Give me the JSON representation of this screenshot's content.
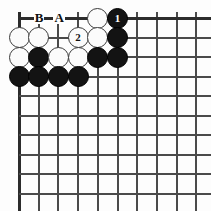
{
  "diagram": {
    "type": "go-board-problem",
    "board": {
      "columns": 10,
      "rows": 10,
      "origin_x": 19,
      "origin_y": 18,
      "spacing_x": 19.7,
      "spacing_y": 19.5,
      "line_color": "#4a4a4a",
      "edge_color": "#2c2c2c",
      "background": "#fdfdfd",
      "top_edge_row": 0,
      "left_edge_col": 0
    },
    "stones": [
      {
        "id": "w-r0c4",
        "color": "white",
        "col": 4,
        "row": 0,
        "label": ""
      },
      {
        "id": "b-r0c5",
        "color": "black",
        "col": 5,
        "row": 0,
        "label": "1"
      },
      {
        "id": "w-r1c0",
        "color": "white",
        "col": 0,
        "row": 1,
        "label": ""
      },
      {
        "id": "w-r1c1",
        "color": "white",
        "col": 1,
        "row": 1,
        "label": ""
      },
      {
        "id": "w-r1c3",
        "color": "white",
        "col": 3,
        "row": 1,
        "label": "2"
      },
      {
        "id": "w-r1c4",
        "color": "white",
        "col": 4,
        "row": 1,
        "label": ""
      },
      {
        "id": "b-r1c5",
        "color": "black",
        "col": 5,
        "row": 1,
        "label": ""
      },
      {
        "id": "w-r2c0",
        "color": "white",
        "col": 0,
        "row": 2,
        "label": ""
      },
      {
        "id": "b-r2c1",
        "color": "black",
        "col": 1,
        "row": 2,
        "label": ""
      },
      {
        "id": "w-r2c2",
        "color": "white",
        "col": 2,
        "row": 2,
        "label": ""
      },
      {
        "id": "w-r2c3",
        "color": "white",
        "col": 3,
        "row": 2,
        "label": ""
      },
      {
        "id": "b-r2c4",
        "color": "black",
        "col": 4,
        "row": 2,
        "label": ""
      },
      {
        "id": "b-r2c5",
        "color": "black",
        "col": 5,
        "row": 2,
        "label": ""
      },
      {
        "id": "b-r3c0",
        "color": "black",
        "col": 0,
        "row": 3,
        "label": ""
      },
      {
        "id": "b-r3c1",
        "color": "black",
        "col": 1,
        "row": 3,
        "label": ""
      },
      {
        "id": "b-r3c2",
        "color": "black",
        "col": 2,
        "row": 3,
        "label": ""
      },
      {
        "id": "b-r3c3",
        "color": "black",
        "col": 3,
        "row": 3,
        "label": ""
      }
    ],
    "point_markers": [
      {
        "id": "marker-b",
        "label": "B",
        "col": 1,
        "row": 0
      },
      {
        "id": "marker-a",
        "label": "A",
        "col": 2,
        "row": 0
      }
    ],
    "move_numbers": [
      {
        "label": "1",
        "color": "black"
      },
      {
        "label": "2",
        "color": "white"
      }
    ]
  }
}
